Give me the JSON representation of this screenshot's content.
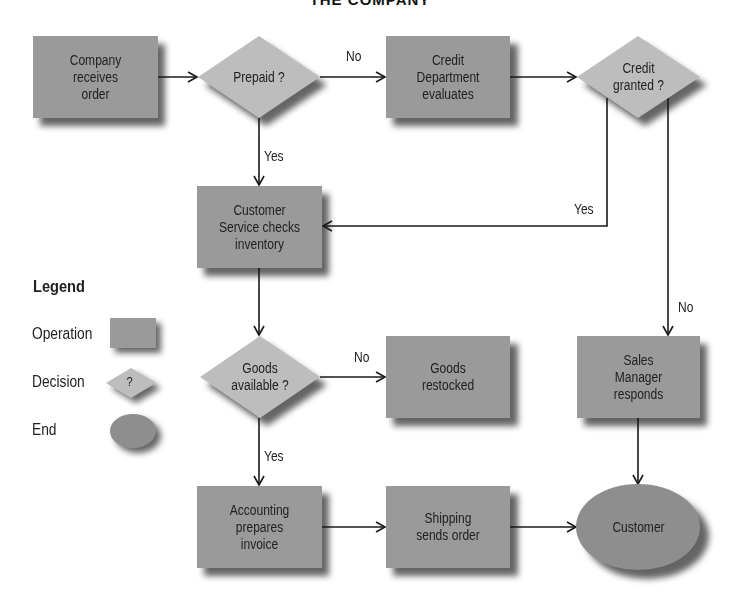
{
  "title": "THE COMPANY",
  "colors": {
    "operation_fill": "#9a9a9a",
    "decision_fill": "#bdbdbd",
    "end_fill": "#8e8e8e",
    "shadow": "#4a4a4a",
    "line": "#1a1a1a",
    "background": "#ffffff"
  },
  "nodes": [
    {
      "id": "receive-order",
      "type": "operation",
      "label": "Company receives order",
      "lines": [
        "Company",
        "receives",
        "order"
      ]
    },
    {
      "id": "prepaid",
      "type": "decision",
      "label": "Prepaid ?",
      "lines": [
        "Prepaid ?"
      ]
    },
    {
      "id": "credit-dept",
      "type": "operation",
      "label": "Credit Department evaluates",
      "lines": [
        "Credit",
        "Department",
        "evaluates"
      ]
    },
    {
      "id": "credit-granted",
      "type": "decision",
      "label": "Credit granted ?",
      "lines": [
        "Credit",
        "granted ?"
      ]
    },
    {
      "id": "customer-service",
      "type": "operation",
      "label": "Customer Service checks inventory",
      "lines": [
        "Customer",
        "Service checks",
        "inventory"
      ]
    },
    {
      "id": "goods-available",
      "type": "decision",
      "label": "Goods available ?",
      "lines": [
        "Goods",
        "available ?"
      ]
    },
    {
      "id": "goods-restocked",
      "type": "operation",
      "label": "Goods restocked",
      "lines": [
        "Goods",
        "restocked"
      ]
    },
    {
      "id": "sales-manager",
      "type": "operation",
      "label": "Sales Manager responds",
      "lines": [
        "Sales",
        "Manager",
        "responds"
      ]
    },
    {
      "id": "accounting",
      "type": "operation",
      "label": "Accounting prepares invoice",
      "lines": [
        "Accounting",
        "prepares",
        "invoice"
      ]
    },
    {
      "id": "shipping",
      "type": "operation",
      "label": "Shipping sends order",
      "lines": [
        "Shipping",
        "sends order"
      ]
    },
    {
      "id": "customer",
      "type": "end",
      "label": "Customer",
      "lines": [
        "Customer"
      ]
    }
  ],
  "edges": [
    {
      "from": "receive-order",
      "to": "prepaid",
      "label": ""
    },
    {
      "from": "prepaid",
      "to": "credit-dept",
      "label": "No"
    },
    {
      "from": "prepaid",
      "to": "customer-service",
      "label": "Yes"
    },
    {
      "from": "credit-dept",
      "to": "credit-granted",
      "label": ""
    },
    {
      "from": "credit-granted",
      "to": "customer-service",
      "label": "Yes"
    },
    {
      "from": "credit-granted",
      "to": "sales-manager",
      "label": "No"
    },
    {
      "from": "customer-service",
      "to": "goods-available",
      "label": ""
    },
    {
      "from": "goods-available",
      "to": "goods-restocked",
      "label": "No"
    },
    {
      "from": "goods-available",
      "to": "accounting",
      "label": "Yes"
    },
    {
      "from": "accounting",
      "to": "shipping",
      "label": ""
    },
    {
      "from": "shipping",
      "to": "customer",
      "label": ""
    },
    {
      "from": "sales-manager",
      "to": "customer",
      "label": ""
    }
  ],
  "edge_labels": {
    "prepaid_no": "No",
    "prepaid_yes": "Yes",
    "credit_yes": "Yes",
    "credit_no": "No",
    "goods_no": "No",
    "goods_yes": "Yes"
  },
  "legend": {
    "title": "Legend",
    "items": [
      {
        "label": "Operation",
        "shape": "rectangle"
      },
      {
        "label": "Decision",
        "shape": "diamond",
        "glyph": "?"
      },
      {
        "label": "End",
        "shape": "ellipse"
      }
    ]
  }
}
